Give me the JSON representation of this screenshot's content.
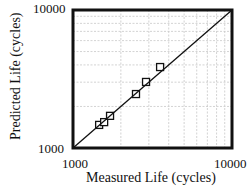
{
  "chart_data": {
    "type": "scatter",
    "title": "",
    "xlabel": "Measured  Life (cycles)",
    "ylabel": "Predicted Life (cycles)",
    "xscale": "log",
    "yscale": "log",
    "xlim": [
      1000,
      10000
    ],
    "ylim": [
      1000,
      10000
    ],
    "x_ticks": [
      "1000",
      "10000"
    ],
    "y_ticks": [
      "1000",
      "10000"
    ],
    "grid": true,
    "legend": null,
    "series": [
      {
        "name": "data",
        "marker": "open-square",
        "x": [
          1460,
          1570,
          1710,
          2490,
          2880,
          3530
        ],
        "y": [
          1470,
          1540,
          1710,
          2460,
          3010,
          3860
        ]
      },
      {
        "name": "1:1 line",
        "style": "solid-line",
        "x": [
          1000,
          10000
        ],
        "y": [
          1000,
          10000
        ]
      }
    ]
  },
  "axes": {
    "x_tick_min": "1000",
    "x_tick_max": "10000",
    "y_tick_min": "1000",
    "y_tick_max": "10000",
    "xlabel": "Measured  Life (cycles)",
    "ylabel": "Predicted Life (cycles)"
  },
  "colors": {
    "axis": "#111111",
    "grid": "#c8c8c8",
    "marker": "#111111"
  }
}
